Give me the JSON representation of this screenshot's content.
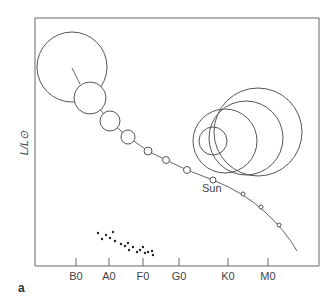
{
  "figure": {
    "panel_label": "a",
    "y_axis_label": "L/L⊙",
    "sun_label": "Sun",
    "x_ticks": [
      {
        "label": "B0",
        "x": 76
      },
      {
        "label": "A0",
        "x": 109
      },
      {
        "label": "F0",
        "x": 143
      },
      {
        "label": "G0",
        "x": 179
      },
      {
        "label": "K0",
        "x": 228
      },
      {
        "label": "M0",
        "x": 268
      }
    ]
  },
  "chart_data": {
    "type": "scatter",
    "title": "",
    "xlabel": "Spectral type",
    "ylabel": "L/L⊙",
    "x_categories": [
      "B0",
      "A0",
      "F0",
      "G0",
      "K0",
      "M0"
    ],
    "annotations": [
      "Sun",
      "a"
    ],
    "main_sequence_stars": [
      {
        "cx": 72,
        "cy": 67,
        "r": 35
      },
      {
        "cx": 90,
        "cy": 98,
        "r": 16
      },
      {
        "cx": 110,
        "cy": 121,
        "r": 10
      },
      {
        "cx": 128,
        "cy": 137,
        "r": 7
      },
      {
        "cx": 148,
        "cy": 151,
        "r": 4
      },
      {
        "cx": 166,
        "cy": 160,
        "r": 3.5
      },
      {
        "cx": 187,
        "cy": 170,
        "r": 3.5
      },
      {
        "cx": 213,
        "cy": 180,
        "r": 3,
        "label": "Sun"
      },
      {
        "cx": 243,
        "cy": 194,
        "r": 2
      },
      {
        "cx": 261,
        "cy": 207,
        "r": 2
      },
      {
        "cx": 279,
        "cy": 225,
        "r": 2
      }
    ],
    "giant_stars": [
      {
        "cx": 258,
        "cy": 132,
        "r": 44
      },
      {
        "cx": 246,
        "cy": 138,
        "r": 37
      },
      {
        "cx": 225,
        "cy": 141,
        "r": 32
      },
      {
        "cx": 213,
        "cy": 141,
        "r": 14
      }
    ],
    "white_dwarfs": [
      [
        98,
        233
      ],
      [
        102,
        239
      ],
      [
        106,
        235
      ],
      [
        110,
        238
      ],
      [
        113,
        232
      ],
      [
        115,
        241
      ],
      [
        121,
        244
      ],
      [
        125,
        246
      ],
      [
        128,
        243
      ],
      [
        129,
        250
      ],
      [
        133,
        247
      ],
      [
        137,
        252
      ],
      [
        140,
        250
      ],
      [
        143,
        247
      ],
      [
        145,
        253
      ],
      [
        148,
        252
      ],
      [
        152,
        251
      ],
      [
        153,
        255
      ]
    ]
  }
}
